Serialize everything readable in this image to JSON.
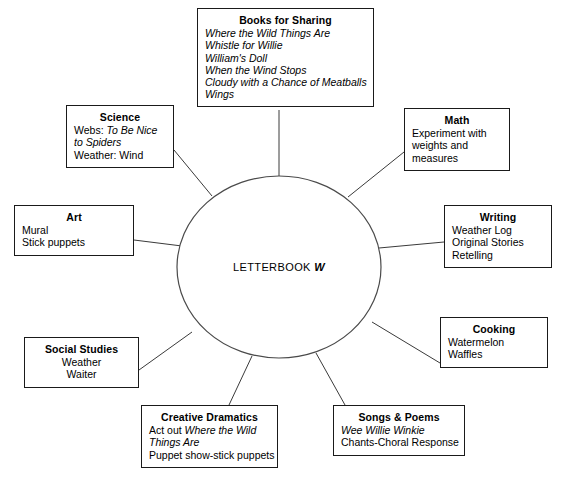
{
  "diagram": {
    "type": "web-cluster",
    "hub": {
      "label_prefix": "LETTERBOOK ",
      "label_letter": "W",
      "shape": "ellipse"
    },
    "nodes": [
      {
        "id": "books",
        "title": "Books for Sharing",
        "align": "left",
        "lines": [
          {
            "text": "Where the Wild Things Are",
            "style": "italic"
          },
          {
            "text": "Whistle for Willie",
            "style": "italic"
          },
          {
            "text": "William's Doll",
            "style": "italic"
          },
          {
            "text": "When the Wind Stops",
            "style": "italic"
          },
          {
            "text": "Cloudy with a Chance of Meatballs",
            "style": "italic"
          },
          {
            "text": "Wings",
            "style": "italic"
          }
        ]
      },
      {
        "id": "science",
        "title": "Science",
        "align": "left",
        "lines": [
          {
            "text": "Webs: To Be Nice to Spiders",
            "style": "mixed",
            "plain": "Webs: ",
            "italic": "To Be Nice to Spiders"
          },
          {
            "text": "Weather: Wind",
            "style": "plain"
          }
        ]
      },
      {
        "id": "math",
        "title": "Math",
        "align": "left",
        "lines": [
          {
            "text": "Experiment with",
            "style": "plain"
          },
          {
            "text": "weights and",
            "style": "plain"
          },
          {
            "text": "measures",
            "style": "plain"
          }
        ]
      },
      {
        "id": "art",
        "title": "Art",
        "align": "left",
        "lines": [
          {
            "text": "Mural",
            "style": "plain"
          },
          {
            "text": "Stick puppets",
            "style": "plain"
          }
        ]
      },
      {
        "id": "writing",
        "title": "Writing",
        "align": "left",
        "lines": [
          {
            "text": "Weather Log",
            "style": "plain"
          },
          {
            "text": "Original Stories",
            "style": "plain"
          },
          {
            "text": "Retelling",
            "style": "plain"
          }
        ]
      },
      {
        "id": "social",
        "title": "Social Studies",
        "align": "center",
        "lines": [
          {
            "text": "Weather",
            "style": "plain"
          },
          {
            "text": "Waiter",
            "style": "plain"
          }
        ]
      },
      {
        "id": "cooking",
        "title": "Cooking",
        "align": "left",
        "lines": [
          {
            "text": "Watermelon",
            "style": "plain"
          },
          {
            "text": "Waffles",
            "style": "plain"
          }
        ]
      },
      {
        "id": "dramatics",
        "title": "Creative Dramatics",
        "align": "left",
        "lines": [
          {
            "text": "Act out Where the Wild Things Are",
            "style": "mixed",
            "plain": "Act out ",
            "italic": "Where the Wild Things Are"
          },
          {
            "text": "Puppet show-stick puppets",
            "style": "plain"
          }
        ]
      },
      {
        "id": "songs",
        "title": "Songs & Poems",
        "align": "left",
        "lines": [
          {
            "text": "Wee Willie Winkie",
            "style": "italic"
          },
          {
            "text": "Chants-Choral Response",
            "style": "plain"
          }
        ]
      }
    ],
    "colors": {
      "background": "#ffffff",
      "box_border": "#1a1a1a",
      "connector": "#3a3a3a",
      "hub_border": "#4a4a4a",
      "text": "#000000"
    }
  }
}
